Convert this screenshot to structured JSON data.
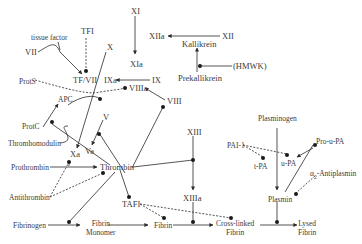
{
  "diagram": {
    "nodes": {
      "XI": "XI",
      "XIa": "XIa",
      "XII": "XII",
      "XIIa": "XIIa",
      "kallikrein": "Kallikrein",
      "prekallikrein": "Prekallikrein",
      "hmwk": "(HMWK)",
      "tissue_factor": "tissue factor",
      "TFI": "TFI",
      "VII": "VII",
      "X": "X",
      "TF_VII": "TF/VII",
      "IXa": "IXa",
      "IX": "IX",
      "VIIIa": "VIIIa",
      "VIII": "VIII",
      "ProtS": "ProtS",
      "APC": "APC",
      "ProtC": "ProtC",
      "thrombomodulin": "Thrombomodulin",
      "V": "V",
      "Xa": "Xa",
      "Va": "Va",
      "prothrombin": "Prothrombin",
      "thrombin": "Thrombin",
      "antithrombin": "Antithrombin",
      "XIII": "XIII",
      "XIIIa": "XIIIa",
      "TAFI": "TAFI",
      "fibrinogen": "Fibrinogen",
      "fibrin_monomer_1": "Fibrin",
      "fibrin_monomer_2": "Monomer",
      "fibrin": "Fibrin",
      "crosslinked_1": "Cross-linked",
      "crosslinked_2": "Fibrin",
      "plasminogen": "Plasminogen",
      "PAI1": "PAI-1",
      "tPA": "t-PA",
      "uPA": "u-PA",
      "pro_uPA": "Pro-u-PA",
      "alpha": "α",
      "alpha_sub": "2",
      "antiplasmin": "-Antiplasmin",
      "plasmin": "Plasmin",
      "lysed_1": "Lysed",
      "lysed_2": "Fibrin"
    },
    "colors": {
      "line": "#2a2a2a",
      "text": "#3a3a3a",
      "background": "#ffffff"
    }
  }
}
